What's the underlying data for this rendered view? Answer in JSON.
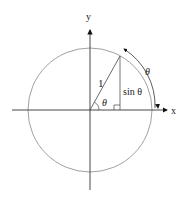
{
  "diagram": {
    "labels": {
      "y_axis": "y",
      "x_axis": "x",
      "radius": "1",
      "angle": "θ",
      "opposite": "sin θ",
      "arc": "θ"
    },
    "colors": {
      "axis": "#222222",
      "circle": "#777777",
      "line": "#444444"
    }
  }
}
